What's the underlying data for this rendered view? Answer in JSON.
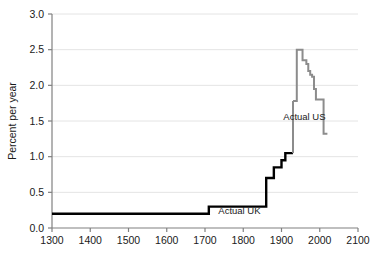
{
  "chart_data": {
    "type": "line",
    "title": "",
    "subtitle": "",
    "xlabel": "",
    "ylabel": "Percent per year",
    "xlim": [
      1300,
      2100
    ],
    "ylim": [
      0.0,
      3.0
    ],
    "xticks": [
      1300,
      1400,
      1500,
      1600,
      1700,
      1800,
      1900,
      2000,
      2100
    ],
    "xtick_labels": [
      "1300",
      "1400",
      "1500",
      "1600",
      "1700",
      "1800",
      "1900",
      "2000",
      "2100"
    ],
    "yticks": [
      0.0,
      0.5,
      1.0,
      1.5,
      2.0,
      2.5,
      3.0
    ],
    "ytick_labels": [
      "0.0",
      "0.5",
      "1.0",
      "1.5",
      "2.0",
      "2.5",
      "3.0"
    ],
    "grid": true,
    "grid_axis": "y",
    "legend": "inline-annotations",
    "drawstyle": "steps-post",
    "series": [
      {
        "name": "Actual UK",
        "color": "#000000",
        "line_width": 2.4,
        "annotation": "Actual UK",
        "annotation_x": 1790,
        "annotation_y": 0.195,
        "x": [
          1300,
          1700,
          1710,
          1820,
          1850,
          1860,
          1870,
          1880,
          1890,
          1900,
          1910,
          1920,
          1930
        ],
        "y": [
          0.2,
          0.2,
          0.3,
          0.3,
          0.3,
          0.7,
          0.7,
          0.85,
          0.85,
          0.95,
          1.05,
          1.05,
          1.05
        ]
      },
      {
        "name": "Actual US",
        "color": "#8c8c8c",
        "line_width": 2.0,
        "annotation": "Actual US",
        "annotation_x": 1960,
        "annotation_y": 1.52,
        "x": [
          1930,
          1940,
          1950,
          1955,
          1960,
          1965,
          1970,
          1975,
          1980,
          1985,
          1990,
          1995,
          2000,
          2005,
          2010,
          2020
        ],
        "y": [
          1.78,
          2.5,
          2.5,
          2.35,
          2.35,
          2.3,
          2.2,
          2.15,
          2.12,
          1.95,
          1.8,
          1.8,
          1.8,
          1.8,
          1.32,
          1.32
        ]
      }
    ],
    "connector": {
      "description": "vertical rise from UK 1.05 at 1930 up to US 1.78 start",
      "x": 1930,
      "y_from": 1.05,
      "y_to": 1.78
    },
    "colors": {
      "uk_line": "#000000",
      "us_line": "#8c8c8c",
      "grid": "#e4e4e4",
      "axis": "#808080",
      "text": "#1a1a1a",
      "background": "#ffffff"
    }
  }
}
